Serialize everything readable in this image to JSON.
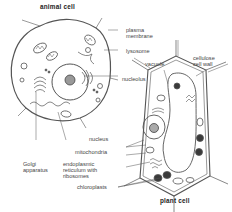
{
  "diagram": {
    "titles": {
      "animal_cell": "animal cell",
      "plant_cell": "plant cell"
    },
    "labels": {
      "plasma_membrane_1": "plasma",
      "plasma_membrane_2": "membrane",
      "lysosome": "lysosome",
      "nucleolus": "nucleolus",
      "cellulose_1": "cellulose",
      "cellulose_2": "cell wall",
      "vacuole": "vacuole",
      "nucleus": "nucleus",
      "mitochondria": "mitochondria",
      "er_1": "endoplasmic",
      "er_2": "reticulum with",
      "er_3": "ribosomes",
      "golgi_1": "Golgi",
      "golgi_2": "apparatus",
      "chloroplasts": "chloroplasts"
    },
    "colors": {
      "line": "#555555",
      "organelle_dark": "#3a3a3a",
      "text": "#444444"
    }
  }
}
